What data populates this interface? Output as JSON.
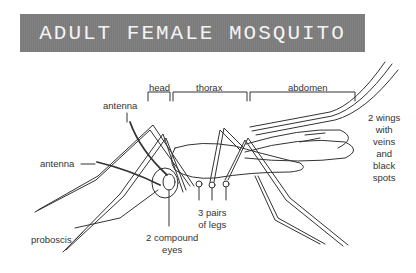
{
  "title": "ADULT FEMALE MOSQUITO",
  "labels": {
    "head": "head",
    "thorax": "thorax",
    "abdomen": "abdomen",
    "antenna_top": "antenna",
    "antenna_left": "antenna",
    "proboscis": "proboscis",
    "eyes_line1": "2 compound",
    "eyes_line2": "eyes",
    "legs_line1": "3 pairs",
    "legs_line2": "of legs",
    "wings_line1": "2 wings",
    "wings_line2": "with",
    "wings_line3": "veins",
    "wings_line4": "and",
    "wings_line5": "black",
    "wings_line6": "spots"
  },
  "colors": {
    "title_bg": "#7a7a7a",
    "title_text": "#f4f4f4",
    "line": "#333333"
  }
}
